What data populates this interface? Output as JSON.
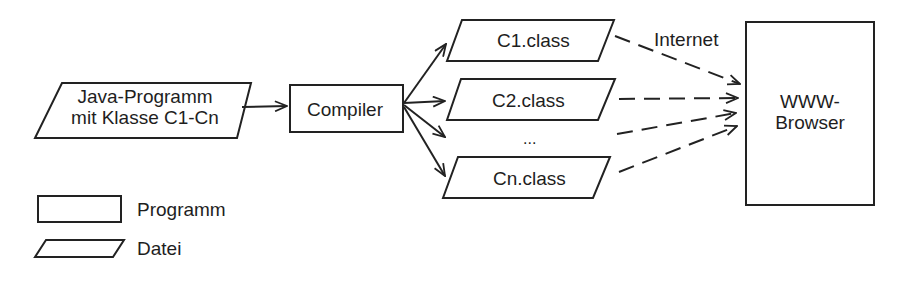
{
  "diagram": {
    "source": {
      "line1": "Java-Programm",
      "line2": "mit Klasse C1-Cn",
      "shape": "parallelogram",
      "kind": "Datei"
    },
    "compiler": {
      "label": "Compiler",
      "shape": "rectangle",
      "kind": "Programm"
    },
    "outputs": [
      {
        "label": "C1.class",
        "shape": "parallelogram"
      },
      {
        "label": "C2.class",
        "shape": "parallelogram"
      },
      {
        "label": "...",
        "shape": "ellipsis"
      },
      {
        "label": "Cn.class",
        "shape": "parallelogram"
      }
    ],
    "network_label": "Internet",
    "browser": {
      "line1": "WWW-",
      "line2": "Browser",
      "shape": "rectangle"
    },
    "edges": [
      {
        "from": "source",
        "to": "compiler",
        "style": "solid"
      },
      {
        "from": "compiler",
        "to": "C1.class",
        "style": "solid"
      },
      {
        "from": "compiler",
        "to": "C2.class",
        "style": "solid"
      },
      {
        "from": "compiler",
        "to": "...",
        "style": "solid"
      },
      {
        "from": "compiler",
        "to": "Cn.class",
        "style": "solid"
      },
      {
        "from": "C1.class",
        "to": "browser",
        "style": "dashed"
      },
      {
        "from": "C2.class",
        "to": "browser",
        "style": "dashed"
      },
      {
        "from": "...",
        "to": "browser",
        "style": "dashed"
      },
      {
        "from": "Cn.class",
        "to": "browser",
        "style": "dashed"
      }
    ]
  },
  "legend": {
    "items": [
      {
        "shape": "rectangle",
        "label": "Programm"
      },
      {
        "shape": "parallelogram",
        "label": "Datei"
      }
    ]
  },
  "colors": {
    "stroke": "#222222",
    "background": "#ffffff"
  }
}
